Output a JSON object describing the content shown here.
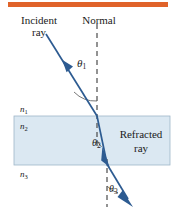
{
  "figure": {
    "type": "optics-ray-diagram",
    "title_rule_color": "#e0632a",
    "background_color": "#ffffff",
    "ray_color": "#2d5b91",
    "slab_fill_color": "#dbe8f2",
    "slab_border_color": "#9fb6c8",
    "normal_line_color": "#3a3a3a",
    "labels": {
      "incident_line1": "Incident",
      "incident_line2": "ray",
      "normal": "Normal",
      "refracted_line1": "Refracted",
      "refracted_line2": "ray"
    },
    "media": [
      {
        "symbol": "n",
        "subscript": "1",
        "region": "above-slab"
      },
      {
        "symbol": "n",
        "subscript": "2",
        "region": "inside-slab"
      },
      {
        "symbol": "n",
        "subscript": "3",
        "region": "below-slab"
      }
    ],
    "angles": [
      {
        "symbol": "θ",
        "subscript": "1",
        "region": "incidence-top"
      },
      {
        "symbol": "θ",
        "subscript": "2",
        "region": "refraction-inside"
      },
      {
        "symbol": "θ",
        "subscript": "3",
        "region": "refraction-bottom"
      }
    ],
    "geometry": {
      "top_rule": {
        "x": 8,
        "y": 2,
        "width": 160,
        "height": 5
      },
      "slab": {
        "x": 14,
        "y": 116,
        "width": 156,
        "height": 49
      },
      "normal_upper": {
        "x": 97,
        "y1": 24,
        "y2": 148
      },
      "normal_lower": {
        "x": 107,
        "y1": 160,
        "y2": 206
      },
      "incident_ray": {
        "x1": 46,
        "y1": 34,
        "x2": 97,
        "y2": 116
      },
      "internal_ray": {
        "x1": 97,
        "y1": 116,
        "x2": 107,
        "y2": 165
      },
      "exit_ray": {
        "x1": 107,
        "y1": 165,
        "x2": 132,
        "y2": 205
      }
    }
  }
}
